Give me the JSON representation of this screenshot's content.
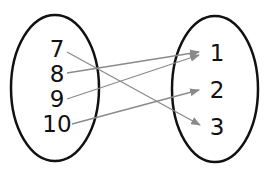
{
  "diagram": {
    "type": "mapping-diagram",
    "domain": {
      "label": "domain-set",
      "values": [
        "7",
        "8",
        "9",
        "10"
      ]
    },
    "range": {
      "label": "range-set",
      "values": [
        "1",
        "2",
        "3"
      ]
    },
    "mappings": [
      {
        "from": "7",
        "to": "3"
      },
      {
        "from": "8",
        "to": "1"
      },
      {
        "from": "9",
        "to": "1"
      },
      {
        "from": "10",
        "to": "2"
      }
    ],
    "colors": {
      "ellipse": "#111111",
      "arrow": "#8a8a8a",
      "text": "#111111"
    }
  }
}
